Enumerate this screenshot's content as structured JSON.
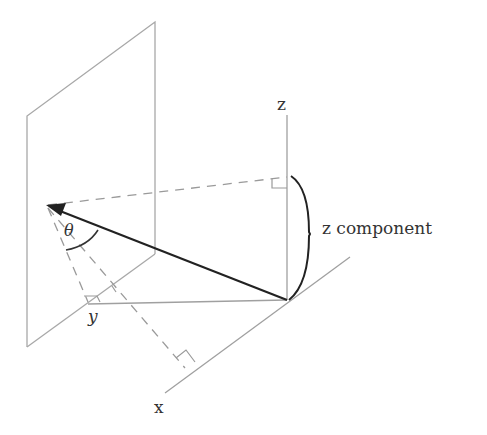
{
  "diagram": {
    "type": "3d-vector-components",
    "labels": {
      "z_axis": "z",
      "x_axis": "x",
      "y_axis": "y",
      "angle": "θ",
      "z_component": "z component"
    },
    "colors": {
      "background": "#ffffff",
      "vector": "#222222",
      "axes": "#a0a0a0",
      "dashed": "#9a9a9a",
      "text": "#333333"
    },
    "elements": [
      "vertical plane",
      "origin at (287,300)",
      "z axis vertical",
      "x axis diagonal down-left",
      "y axis horizontal left",
      "vector from origin to plane point",
      "dashed projection lines with right-angle marks",
      "angle theta arc",
      "z component brace"
    ]
  }
}
